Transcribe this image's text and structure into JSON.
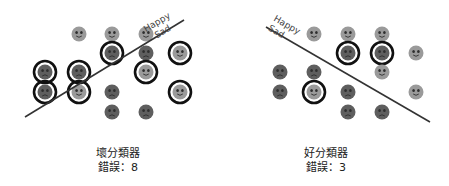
{
  "colors": {
    "happy_face": "#9a9a9a",
    "sad_face": "#5e5e5e",
    "feature": "#2e2e2e",
    "ring": "#111111",
    "line": "#333333",
    "label": "#444444"
  },
  "panels": [
    {
      "id": "bad",
      "title": "壞分類器",
      "error_label": "錯誤：8",
      "line": {
        "x1": 25,
        "y1": 117,
        "x2": 184,
        "y2": 20
      },
      "labels": {
        "happy": "Happy",
        "sad": "Sad",
        "x": 172,
        "y": 19,
        "angle": -31
      },
      "caption": {
        "x": 58,
        "y": 147
      },
      "faces": [
        {
          "x": 79,
          "y": 34,
          "mood": "happy",
          "circled": false
        },
        {
          "x": 112,
          "y": 34,
          "mood": "happy",
          "circled": false
        },
        {
          "x": 146,
          "y": 34,
          "mood": "happy",
          "circled": false
        },
        {
          "x": 112,
          "y": 53,
          "mood": "sad",
          "circled": true
        },
        {
          "x": 146,
          "y": 53,
          "mood": "sad",
          "circled": false
        },
        {
          "x": 180,
          "y": 53,
          "mood": "happy",
          "circled": true
        },
        {
          "x": 45,
          "y": 72,
          "mood": "sad",
          "circled": true
        },
        {
          "x": 79,
          "y": 72,
          "mood": "sad",
          "circled": true
        },
        {
          "x": 146,
          "y": 72,
          "mood": "happy",
          "circled": true
        },
        {
          "x": 45,
          "y": 92,
          "mood": "sad",
          "circled": true
        },
        {
          "x": 79,
          "y": 92,
          "mood": "happy",
          "circled": true
        },
        {
          "x": 112,
          "y": 92,
          "mood": "sad",
          "circled": false
        },
        {
          "x": 180,
          "y": 92,
          "mood": "happy",
          "circled": true
        },
        {
          "x": 112,
          "y": 112,
          "mood": "sad",
          "circled": false
        },
        {
          "x": 146,
          "y": 112,
          "mood": "sad",
          "circled": false
        }
      ]
    },
    {
      "id": "good",
      "title": "好分類器",
      "error_label": "錯誤：3",
      "line": {
        "x1": 266,
        "y1": 27,
        "x2": 430,
        "y2": 122
      },
      "labels": {
        "happy": "Happy",
        "sad": "Sad",
        "x": 272,
        "y": 22,
        "angle": 30
      },
      "caption": {
        "x": 266,
        "y": 147
      },
      "faces": [
        {
          "x": 314,
          "y": 34,
          "mood": "happy",
          "circled": false
        },
        {
          "x": 348,
          "y": 34,
          "mood": "happy",
          "circled": false
        },
        {
          "x": 382,
          "y": 34,
          "mood": "happy",
          "circled": false
        },
        {
          "x": 348,
          "y": 53,
          "mood": "sad",
          "circled": true
        },
        {
          "x": 382,
          "y": 53,
          "mood": "sad",
          "circled": true
        },
        {
          "x": 416,
          "y": 53,
          "mood": "happy",
          "circled": false
        },
        {
          "x": 280,
          "y": 72,
          "mood": "sad",
          "circled": false
        },
        {
          "x": 314,
          "y": 72,
          "mood": "sad",
          "circled": false
        },
        {
          "x": 382,
          "y": 72,
          "mood": "happy",
          "circled": false
        },
        {
          "x": 280,
          "y": 92,
          "mood": "sad",
          "circled": false
        },
        {
          "x": 314,
          "y": 92,
          "mood": "happy",
          "circled": true
        },
        {
          "x": 348,
          "y": 92,
          "mood": "sad",
          "circled": false
        },
        {
          "x": 416,
          "y": 92,
          "mood": "happy",
          "circled": false
        },
        {
          "x": 348,
          "y": 112,
          "mood": "sad",
          "circled": false
        },
        {
          "x": 382,
          "y": 112,
          "mood": "sad",
          "circled": false
        }
      ]
    }
  ]
}
